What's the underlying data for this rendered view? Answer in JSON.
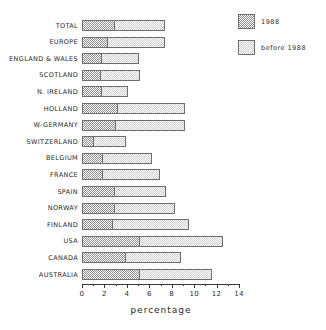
{
  "chart_data": {
    "type": "bar",
    "orientation": "horizontal",
    "stacked": true,
    "title": "",
    "xlabel": "percentage",
    "ylabel": "",
    "xlim": [
      0,
      14
    ],
    "xticks": [
      0,
      2,
      4,
      6,
      8,
      10,
      12,
      14
    ],
    "xtick_labels": [
      "0",
      "2",
      "4",
      "6",
      "8",
      "10",
      "12",
      "14"
    ],
    "minor_tick_step": 1,
    "grid": false,
    "legend_position": "top-right",
    "categories": [
      "TOTAL",
      "EUROPE",
      "ENGLAND & WALES",
      "SCOTLAND",
      "N. IRELAND",
      "HOLLAND",
      "W-GERMANY",
      "SWITZERLAND",
      "BELGIUM",
      "FRANCE",
      "SPAIN",
      "NORWAY",
      "FINLAND",
      "USA",
      "CANADA",
      "AUSTRALIA"
    ],
    "series": [
      {
        "name": "1988",
        "color": "#8f8f8f",
        "values": [
          2.9,
          2.3,
          1.8,
          1.7,
          1.8,
          3.2,
          3.0,
          1.1,
          1.9,
          1.9,
          2.9,
          2.9,
          2.8,
          5.2,
          3.9,
          5.2
        ]
      },
      {
        "name": "before 1988",
        "color": "#cfcfcf",
        "values": [
          4.5,
          5.1,
          3.3,
          3.5,
          2.3,
          6.0,
          6.2,
          2.8,
          4.3,
          5.1,
          4.6,
          5.4,
          6.7,
          7.4,
          4.9,
          6.4
        ]
      }
    ],
    "totals": [
      7.4,
      7.4,
      5.1,
      5.2,
      4.1,
      9.2,
      9.2,
      3.9,
      6.2,
      7.0,
      7.5,
      8.3,
      9.5,
      12.6,
      8.8,
      11.6
    ]
  },
  "legend": {
    "items": [
      {
        "label": "1988",
        "swatch": "dark-dither-swatch"
      },
      {
        "label": "before 1988",
        "swatch": "light-dither-swatch"
      }
    ]
  },
  "axis": {
    "x_title": "percentage"
  }
}
